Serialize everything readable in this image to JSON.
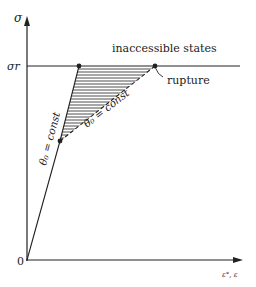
{
  "diagram": {
    "axes": {
      "y_label": "σ",
      "x_label": "ε°, ε",
      "origin_label": "0",
      "level_label": "σr"
    },
    "annotations": {
      "region_above": "inaccessible states",
      "rupture_point": "rupture",
      "theta_line_1": "θ₀ = const",
      "theta_line_2": "θ₀ = const"
    },
    "points": {
      "origin": [
        27,
        260
      ],
      "lower_node": [
        60,
        141
      ],
      "upper_node": [
        79,
        66
      ],
      "rupture": [
        155,
        66
      ]
    },
    "colors": {
      "stroke": "#222222",
      "background": "#ffffff"
    }
  }
}
